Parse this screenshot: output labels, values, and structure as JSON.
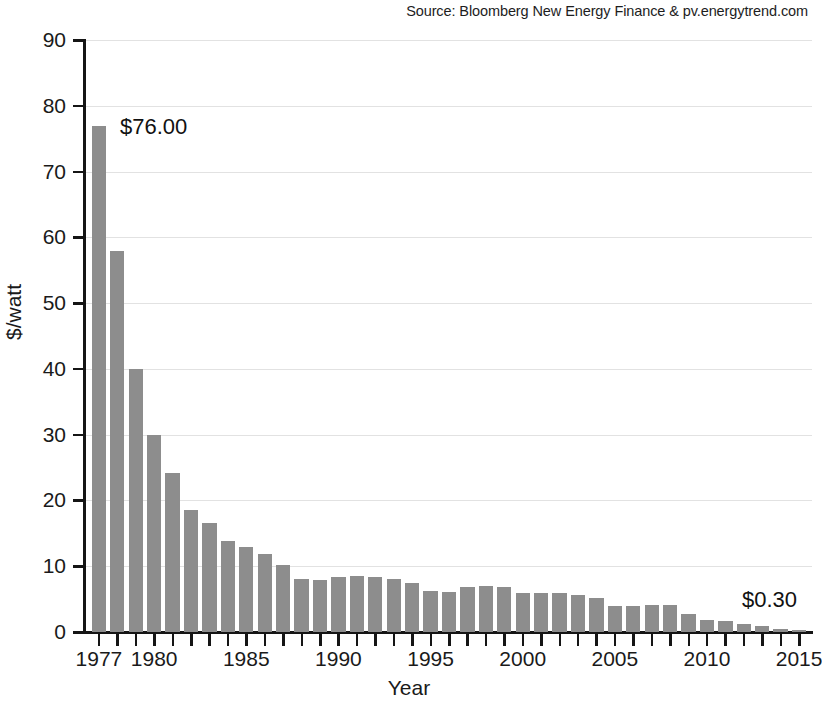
{
  "source": {
    "text": "Source: Bloomberg New Energy Finance & pv.energytrend.com"
  },
  "annotations": [
    {
      "name": "first-value-label",
      "text": "$76.00",
      "year": 1977
    },
    {
      "name": "last-value-label",
      "text": "$0.30",
      "year": 2015
    }
  ],
  "chart_data": {
    "type": "bar",
    "title": "",
    "subtitle": "",
    "xlabel": "Year",
    "ylabel": "$/watt",
    "ylim": [
      0,
      90
    ],
    "ytick_labels": [
      "0",
      "10",
      "20",
      "30",
      "40",
      "50",
      "60",
      "70",
      "80",
      "90"
    ],
    "ytick_values": [
      0,
      10,
      20,
      30,
      40,
      50,
      60,
      70,
      80,
      90
    ],
    "xtick_labels": [
      "1977",
      "1980",
      "1985",
      "1990",
      "1995",
      "2000",
      "2005",
      "2010",
      "2015"
    ],
    "xtick_values": [
      1977,
      1980,
      1985,
      1990,
      1995,
      2000,
      2005,
      2010,
      2015
    ],
    "xlim": [
      1976.3,
      2015.7
    ],
    "grid": "horizontal",
    "legend": "none",
    "bar_color": "#8d8d8d",
    "categories": [
      1977,
      1978,
      1979,
      1980,
      1981,
      1982,
      1983,
      1984,
      1985,
      1986,
      1987,
      1988,
      1989,
      1990,
      1991,
      1992,
      1993,
      1994,
      1995,
      1996,
      1997,
      1998,
      1999,
      2000,
      2001,
      2002,
      2003,
      2004,
      2005,
      2006,
      2007,
      2008,
      2009,
      2010,
      2011,
      2012,
      2013,
      2014,
      2015
    ],
    "values": [
      77.0,
      58.0,
      40.0,
      30.0,
      24.2,
      18.6,
      16.5,
      13.8,
      13.0,
      11.8,
      10.2,
      8.0,
      7.9,
      8.4,
      8.5,
      8.3,
      8.0,
      7.4,
      6.3,
      6.1,
      6.8,
      7.0,
      6.9,
      6.0,
      5.9,
      5.9,
      5.6,
      5.2,
      3.9,
      4.0,
      4.1,
      4.1,
      2.8,
      1.8,
      1.6,
      1.2,
      0.9,
      0.5,
      0.3
    ]
  }
}
